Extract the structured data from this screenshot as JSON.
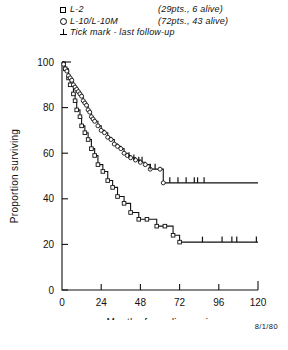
{
  "legend": {
    "rows": [
      {
        "symbol": "square-marker",
        "label": "L-2",
        "note": "(29pts., 6 alive)"
      },
      {
        "symbol": "circle-marker",
        "label": "L-10/L-10M",
        "note": "(72pts., 43 alive)"
      },
      {
        "symbol": "tick-marker",
        "label": "Tick mark - last follow-up",
        "note": ""
      }
    ]
  },
  "footer": {
    "date": "8/1/80"
  },
  "chart_data": {
    "type": "line",
    "title": "",
    "xlabel": "Months  from diagnosis",
    "ylabel": "Proportion surviving",
    "xlim": [
      0,
      120
    ],
    "ylim": [
      0,
      100
    ],
    "xticks": [
      0,
      24,
      48,
      72,
      96,
      120
    ],
    "yticks": [
      0,
      20,
      40,
      60,
      80,
      100
    ],
    "xtick_labels": [
      "0",
      "24",
      "48",
      "72",
      "96",
      "120"
    ],
    "ytick_labels": [
      "0",
      "20",
      "40",
      "60",
      "80",
      "100"
    ],
    "grid": false,
    "legend_position": "above-plot",
    "step_style": "post",
    "series": [
      {
        "name": "L-2",
        "marker": "square",
        "n_patients": 29,
        "n_alive": 6,
        "x": [
          0,
          2,
          4,
          5,
          7,
          8,
          9,
          11,
          12,
          14,
          16,
          18,
          20,
          22,
          25,
          28,
          31,
          34,
          38,
          42,
          47,
          52,
          58,
          63,
          68,
          72,
          120
        ],
        "y": [
          100,
          97,
          93,
          90,
          86,
          83,
          79,
          76,
          72,
          69,
          66,
          62,
          59,
          55,
          52,
          48,
          45,
          41,
          38,
          34,
          31,
          31,
          28,
          28,
          24,
          21,
          21
        ],
        "censor_x": [
          86,
          98,
          104,
          107,
          119
        ],
        "censor_y": [
          21,
          21,
          21,
          21,
          21
        ]
      },
      {
        "name": "L-10/L-10M",
        "marker": "circle",
        "n_patients": 72,
        "n_alive": 43,
        "x": [
          0,
          1,
          2,
          3,
          4,
          5,
          6,
          7,
          8,
          9,
          10,
          11,
          12,
          13,
          14,
          15,
          16,
          17,
          18,
          19,
          20,
          22,
          24,
          26,
          28,
          30,
          32,
          34,
          36,
          38,
          40,
          42,
          45,
          48,
          51,
          54,
          60,
          62,
          120
        ],
        "y": [
          100,
          99,
          97,
          96,
          94,
          93,
          92,
          90,
          89,
          88,
          87,
          86,
          85,
          83,
          82,
          81,
          79,
          78,
          76,
          75,
          74,
          72,
          70,
          69,
          67,
          66,
          64,
          63,
          62,
          60,
          59,
          58,
          57,
          56,
          55,
          53,
          53,
          47,
          47
        ],
        "censor_x": [
          41,
          44,
          47,
          49,
          54,
          57,
          66,
          71,
          76,
          81,
          83,
          87
        ],
        "censor_y": [
          58,
          57,
          56,
          56,
          53,
          53,
          47,
          47,
          47,
          47,
          47,
          47
        ]
      }
    ]
  }
}
